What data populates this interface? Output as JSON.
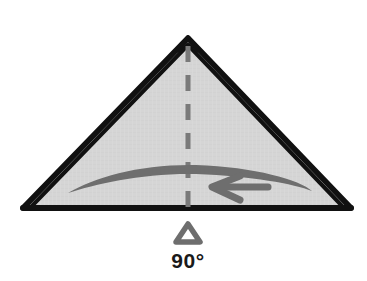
{
  "figure": {
    "kind": "origami-fold-instruction",
    "title": "",
    "background_color": "#ffffff"
  },
  "shape": {
    "name": "folded-triangle",
    "fill_color": "#d4d4d4",
    "outline_color": "#111111",
    "apex": {
      "x": 188,
      "y": 38
    },
    "base_left": {
      "x": 23,
      "y": 208
    },
    "base_right": {
      "x": 351,
      "y": 208
    },
    "layer_edges": 2,
    "outline_width": 5
  },
  "crease": {
    "name": "center-crease",
    "style": "dashed",
    "color": "#7a7a7a",
    "width": 5,
    "dash_pattern": "16 13",
    "from": {
      "x": 188,
      "y": 44
    },
    "to": {
      "x": 188,
      "y": 208
    }
  },
  "arrow": {
    "name": "fold-direction-arrow",
    "color": "#6e6e6e",
    "direction": "left",
    "tail_start": {
      "x": 312,
      "y": 190
    },
    "tail_end": {
      "x": 68,
      "y": 193
    },
    "head_tip": {
      "x": 212,
      "y": 187
    },
    "label": ""
  },
  "angle_marker": {
    "name": "angle-marker",
    "glyph": "triangle-outline",
    "color": "#6e6e6e",
    "position": {
      "x": 188,
      "y": 233
    },
    "value": "90°"
  }
}
